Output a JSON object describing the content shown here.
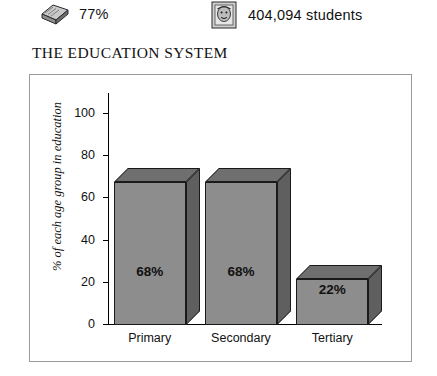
{
  "stats": [
    {
      "icon": "book-icon",
      "value": "77%"
    },
    {
      "icon": "face-icon",
      "value": "404,094 students"
    }
  ],
  "section_title": "THE EDUCATION SYSTEM",
  "chart_data": {
    "type": "bar",
    "title": "THE EDUCATION SYSTEM",
    "categories": [
      "Primary",
      "Secondary",
      "Tertiary"
    ],
    "values": [
      68,
      68,
      22
    ],
    "data_labels": [
      "68%",
      "68%",
      "22%"
    ],
    "xlabel": "",
    "ylabel": "% of each age group in education",
    "ylim": [
      0,
      110
    ],
    "yticks": [
      0,
      20,
      40,
      60,
      80,
      100
    ],
    "ytick_labels": [
      "0",
      "20",
      "40",
      "60",
      "80",
      "100"
    ],
    "grid": false,
    "legend": false,
    "bar_color": "#8d8d8d",
    "bar_top_color": "#6f6f6f",
    "bar_side_color": "#5f5f5f",
    "axis_color": "#000000"
  }
}
